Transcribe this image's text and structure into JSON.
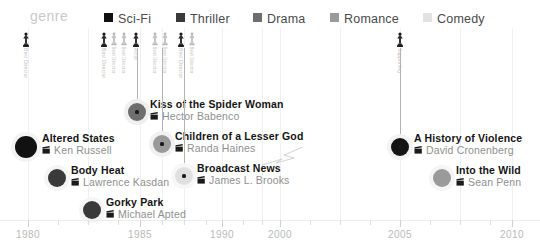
{
  "legend": {
    "title": "genre",
    "items": [
      {
        "label": "Sci-Fi",
        "color": "#111111",
        "x": 104
      },
      {
        "label": "Thriller",
        "color": "#3a3a3a",
        "x": 176
      },
      {
        "label": "Drama",
        "color": "#6e6e6e",
        "x": 253
      },
      {
        "label": "Romance",
        "color": "#9a9a9a",
        "x": 330
      },
      {
        "label": "Comedy",
        "color": "#e2e2e2",
        "x": 423
      }
    ]
  },
  "chart_data": {
    "type": "scatter",
    "title": "genre",
    "xlabel": "",
    "ylabel": "",
    "grid": true,
    "legend_position": "top",
    "xlim": [
      1980,
      2010
    ],
    "categories": [
      "Sci-Fi",
      "Thriller",
      "Drama",
      "Romance",
      "Comedy"
    ],
    "category_colors": [
      "#111111",
      "#3a3a3a",
      "#6e6e6e",
      "#9a9a9a",
      "#e2e2e2"
    ],
    "axis": {
      "labels": [
        "1980",
        "1985",
        "1990",
        "2000",
        "2005",
        "2010"
      ],
      "label_x": [
        28,
        140,
        222,
        280,
        400,
        512
      ],
      "tick_x": [
        28,
        58,
        88,
        118,
        140,
        162,
        184,
        206,
        222,
        243,
        262,
        280,
        310,
        340,
        370,
        400,
        430,
        460,
        490,
        512
      ],
      "major_tick_x": [
        28,
        140,
        222,
        280,
        400,
        512
      ]
    },
    "gridlines_x": [
      28,
      88,
      140,
      162,
      184,
      222,
      262,
      280,
      340,
      400,
      460,
      512
    ],
    "points": [
      {
        "title": "Altered States",
        "director": "Ken Russell",
        "genre": "Sci-Fi",
        "color": "#111111",
        "year": 1980,
        "x": 26,
        "y": 119,
        "r": 11,
        "label_x": 42,
        "label_y": 104,
        "stem": false,
        "halo": "#f3f3f3"
      },
      {
        "title": "Body Heat",
        "director": "Lawrence Kasdan",
        "genre": "Thriller",
        "color": "#3a3a3a",
        "year": 1981,
        "x": 57,
        "y": 150,
        "r": 9,
        "label_x": 71,
        "label_y": 136,
        "stem": false,
        "halo": "#f5f5f5"
      },
      {
        "title": "Gorky Park",
        "director": "Michael Apted",
        "genre": "Thriller",
        "color": "#3a3a3a",
        "year": 1983,
        "x": 92,
        "y": 182,
        "r": 9,
        "label_x": 106,
        "label_y": 168,
        "stem": false,
        "halo": "#f5f5f5"
      },
      {
        "title": "Kiss of the Spider Woman",
        "director": "Hector Babenco",
        "genre": "Drama",
        "color": "#6e6e6e",
        "year": 1985,
        "x": 137,
        "y": 84,
        "r": 9,
        "label_x": 150,
        "label_y": 70,
        "stem": true,
        "stem_top": 20,
        "halo": "#efefef"
      },
      {
        "title": "Children of a Lesser God",
        "director": "Randa Haines",
        "genre": "Drama",
        "color": "#9a9a9a",
        "year": 1986,
        "x": 162,
        "y": 116,
        "r": 9,
        "label_x": 175,
        "label_y": 102,
        "stem": true,
        "stem_top": 20,
        "halo": "#f1f1f1"
      },
      {
        "title": "Broadcast News",
        "director": "James L. Brooks",
        "genre": "Comedy",
        "color": "#e0e0e0",
        "year": 1987,
        "x": 184,
        "y": 148,
        "r": 9,
        "label_x": 197,
        "label_y": 134,
        "stem": true,
        "stem_top": 20,
        "halo": "#f7f7f7"
      },
      {
        "title": "A History of Violence",
        "director": "David Cronenberg",
        "genre": "Sci-Fi",
        "color": "#141414",
        "year": 2005,
        "x": 400,
        "y": 119,
        "r": 9,
        "label_x": 414,
        "label_y": 104,
        "stem": true,
        "stem_top": 20,
        "halo": "#f3f3f3"
      },
      {
        "title": "Into the Wild",
        "director": "Sean Penn",
        "genre": "Romance",
        "color": "#9a9a9a",
        "year": 2007,
        "x": 442,
        "y": 150,
        "r": 9,
        "label_x": 456,
        "label_y": 136,
        "stem": false,
        "halo": "#f5f5f5"
      }
    ],
    "awards": [
      {
        "label": "Best Director",
        "x": 26,
        "dark": true,
        "scale": 1.0
      },
      {
        "label": "Best Director",
        "x": 104,
        "dark": true,
        "scale": 1.0
      },
      {
        "label": "Best Director",
        "x": 114,
        "dark": false,
        "scale": 0.9
      },
      {
        "label": "Best Director",
        "x": 124,
        "dark": false,
        "scale": 0.9
      },
      {
        "label": "Actor",
        "x": 136,
        "dark": true,
        "scale": 1.0
      },
      {
        "label": "Best Director",
        "x": 155,
        "dark": false,
        "scale": 0.9
      },
      {
        "label": "Best Director",
        "x": 165,
        "dark": false,
        "scale": 0.9
      },
      {
        "label": "Best Director",
        "x": 181,
        "dark": true,
        "scale": 1.0
      },
      {
        "label": "Best Director",
        "x": 192,
        "dark": false,
        "scale": 0.9
      },
      {
        "label": "Supporting",
        "x": 400,
        "dark": true,
        "scale": 1.0
      }
    ]
  }
}
